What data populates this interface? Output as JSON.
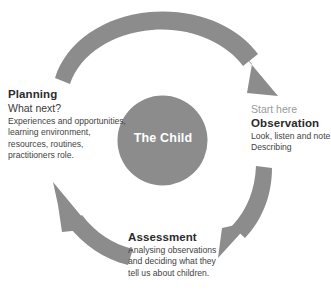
{
  "diagram": {
    "center": {
      "label": "The Child",
      "shape": "circle",
      "fill_color": "#8c8c8c",
      "text_color": "#ffffff"
    },
    "arrow_color": "#8c8c8c",
    "background_color": "#ffffff",
    "arrows": [
      {
        "name": "planning-to-observation-arrow",
        "from": "Planning",
        "to": "Observation",
        "position": "top",
        "direction": "clockwise"
      },
      {
        "name": "observation-to-assessment-arrow",
        "from": "Observation",
        "to": "Assessment",
        "position": "right",
        "direction": "clockwise"
      },
      {
        "name": "assessment-to-planning-arrow",
        "from": "Assessment",
        "to": "Planning",
        "position": "left",
        "direction": "clockwise"
      }
    ],
    "stages": {
      "planning": {
        "heading": "Planning",
        "lead": "What next?",
        "lines": [
          "Experiences and opportunities,",
          "learning environment,",
          "resources, routines,",
          "practitioners role."
        ]
      },
      "observation": {
        "eyebrow": "Start here",
        "heading": "Observation",
        "lines": [
          "Look, listen and note.",
          "Describing"
        ]
      },
      "assessment": {
        "heading": "Assessment",
        "lines": [
          "Analysing observations",
          "and deciding what they",
          "tell us about children."
        ]
      }
    }
  }
}
